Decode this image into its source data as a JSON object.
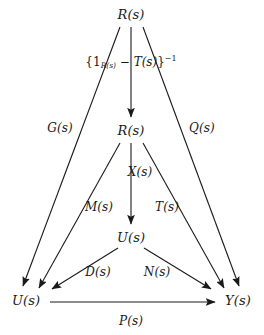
{
  "diagram": {
    "background_color": "#ffffff",
    "stroke_color": "#1a1a1a",
    "nodes": [
      {
        "id": "r_top",
        "label": "R(s)",
        "x": 131,
        "y": 14
      },
      {
        "id": "r_middle",
        "label": "R(s)",
        "x": 131,
        "y": 130
      },
      {
        "id": "u_middle",
        "label": "U(s)",
        "x": 131,
        "y": 237
      },
      {
        "id": "u_bottom",
        "label": "U(s)",
        "x": 26,
        "y": 300
      },
      {
        "id": "y_bottom",
        "label": "Y(s)",
        "x": 238,
        "y": 300
      }
    ],
    "edge_labels": [
      {
        "id": "g",
        "label": "G(s)",
        "x": 60,
        "y": 128
      },
      {
        "id": "q",
        "label": "Q(s)",
        "x": 202,
        "y": 128
      },
      {
        "id": "x",
        "label": "X(s)",
        "x": 140,
        "y": 172
      },
      {
        "id": "m",
        "label": "M(s)",
        "x": 99,
        "y": 207
      },
      {
        "id": "t",
        "label": "T(s)",
        "x": 167,
        "y": 207
      },
      {
        "id": "d",
        "label": "D(s)",
        "x": 98,
        "y": 272
      },
      {
        "id": "n",
        "label": "N(s)",
        "x": 157,
        "y": 272
      },
      {
        "id": "p",
        "label": "P(s)",
        "x": 131,
        "y": 321
      }
    ],
    "formula": {
      "id": "inverse-formula",
      "full_text": "{1_{R(s)} - T(s)}^{-1}",
      "open_brace": "{1",
      "subscript": "R(s)",
      "minus": " − ",
      "operator_term": "T(s)",
      "close_brace": "}",
      "exponent": "−1",
      "x": 131,
      "y": 62
    },
    "arrows": [
      {
        "id": "r_top-to-u_bottom",
        "label_ref": "g",
        "from": "r_top",
        "to": "u_bottom"
      },
      {
        "id": "r_top-to-r_middle",
        "label_ref": "formula",
        "from": "r_top",
        "to": "r_middle"
      },
      {
        "id": "r_top-to-y_bottom",
        "label_ref": "q",
        "from": "r_top",
        "to": "y_bottom"
      },
      {
        "id": "r_middle-to-u_bottom",
        "label_ref": "m",
        "from": "r_middle",
        "to": "u_bottom"
      },
      {
        "id": "r_middle-to-u_middle",
        "label_ref": "x",
        "from": "r_middle",
        "to": "u_middle"
      },
      {
        "id": "r_middle-to-y_bottom",
        "label_ref": "t",
        "from": "r_middle",
        "to": "y_bottom"
      },
      {
        "id": "u_middle-to-u_bottom",
        "label_ref": "d",
        "from": "u_middle",
        "to": "u_bottom"
      },
      {
        "id": "u_middle-to-y_bottom",
        "label_ref": "n",
        "from": "u_middle",
        "to": "y_bottom"
      },
      {
        "id": "u_bottom-to-y_bottom",
        "label_ref": "p",
        "from": "u_bottom",
        "to": "y_bottom"
      }
    ]
  }
}
